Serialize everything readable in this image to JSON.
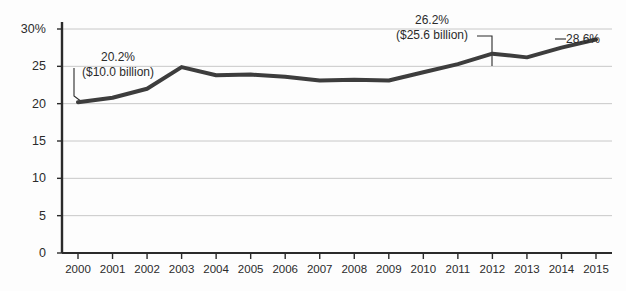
{
  "chart_data": {
    "type": "line",
    "title": "",
    "subtitle": "",
    "xlabel": "",
    "ylabel": "",
    "categories": [
      "2000",
      "2001",
      "2002",
      "2003",
      "2004",
      "2005",
      "2006",
      "2007",
      "2008",
      "2009",
      "2010",
      "2011",
      "2012",
      "2013",
      "2014",
      "2015"
    ],
    "values": [
      20.2,
      20.8,
      22.0,
      24.9,
      23.8,
      23.9,
      23.6,
      23.1,
      23.2,
      23.1,
      24.2,
      25.3,
      26.7,
      26.2,
      27.5,
      28.6
    ],
    "ylim": [
      0,
      30
    ],
    "yticks": [
      0,
      5,
      10,
      15,
      20,
      25,
      30
    ],
    "ytick_labels": [
      "0",
      "5",
      "10",
      "15",
      "20",
      "25",
      "30%"
    ],
    "xtick_labels": [
      "2000",
      "2001",
      "2002",
      "2003",
      "2004",
      "2005",
      "2006",
      "2007",
      "2008",
      "2009",
      "2010",
      "2011",
      "2012",
      "2013",
      "2014",
      "2015"
    ],
    "grid": "horizontal",
    "legend": "none",
    "series_color": "#3d3d3d",
    "grid_color": "#c8c8c8",
    "axis_color": "#2b2b2b",
    "background_color": "#fdfdfd",
    "annotations": [
      {
        "id": "left",
        "line1": "20.2%",
        "line2": "($10.0 billion)",
        "points_to_category": "2000",
        "points_to_value": 20.2
      },
      {
        "id": "middle",
        "line1": "26.2%",
        "line2": "($25.6 billion)",
        "points_to_category": "2013",
        "points_to_value": 26.2
      },
      {
        "id": "right",
        "line1": "28.6%",
        "line2": "",
        "points_to_category": "2015",
        "points_to_value": 28.6
      }
    ]
  }
}
